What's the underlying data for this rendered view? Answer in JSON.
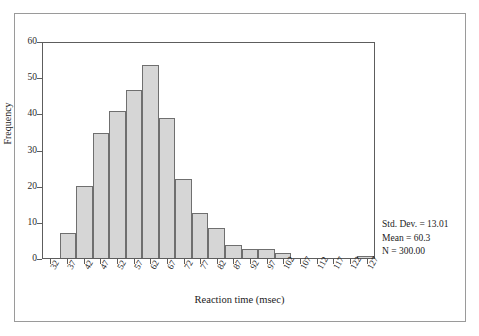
{
  "chart_data": {
    "type": "bar",
    "title": "",
    "xlabel": "Reaction time (msec)",
    "ylabel": "Frequency",
    "categories": [
      "32",
      "37",
      "42",
      "47",
      "52",
      "57",
      "62",
      "67",
      "72",
      "77",
      "82",
      "87",
      "92",
      "97",
      "102",
      "107",
      "112",
      "117",
      "122",
      "127"
    ],
    "values": [
      0,
      7,
      20,
      35,
      41,
      47,
      54,
      39,
      22,
      12.5,
      8.5,
      3.5,
      2.5,
      2.5,
      1.5,
      0,
      0,
      0,
      0,
      0.5
    ],
    "ylim": [
      0,
      60
    ],
    "yticks": [
      0,
      10,
      20,
      30,
      40,
      50,
      60
    ],
    "ytick_labels": [
      "0",
      "10",
      "20",
      "30",
      "40",
      "50",
      "60"
    ],
    "grid": false,
    "legend": "none",
    "bar_fill": "#d6d6d6",
    "bar_edge": "#6f6f6f",
    "annotations": {
      "std_dev": "Std. Dev. = 13.01",
      "mean": "Mean = 60.3",
      "n": "N = 300.00"
    }
  }
}
